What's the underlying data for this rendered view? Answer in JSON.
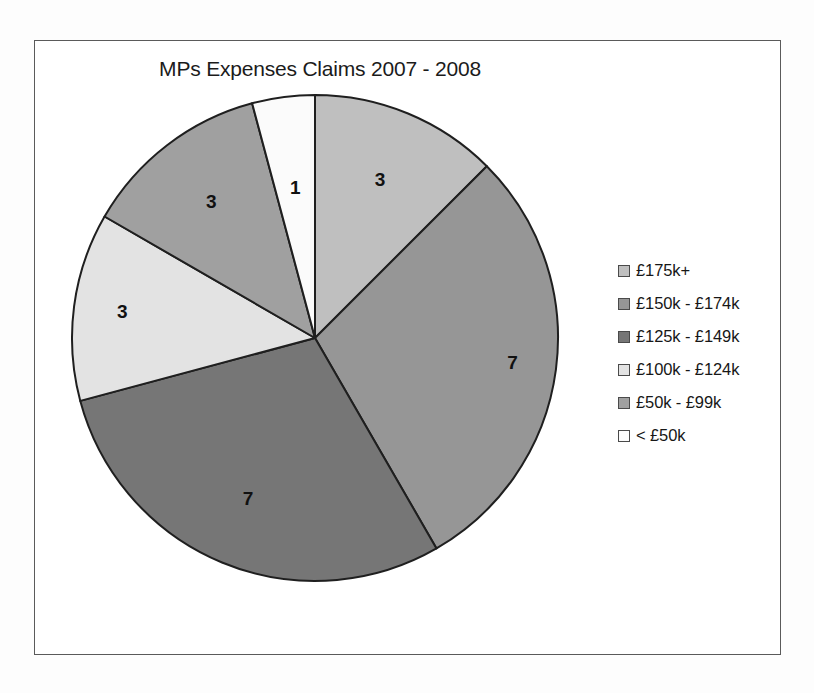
{
  "chart_data": {
    "type": "pie",
    "title": "MPs Expenses Claims 2007 - 2008",
    "xlabel": "",
    "ylabel": "",
    "legend_position": "right",
    "grid": false,
    "total": 24,
    "categories": [
      "£175k+",
      "£150k -  £174k",
      "£125k -  £149k",
      "£100k -  £124k",
      "£50k - £99k",
      "< £50k"
    ],
    "values": [
      3,
      7,
      7,
      3,
      3,
      1
    ],
    "colors": [
      "#bfbfbf",
      "#969696",
      "#767676",
      "#e3e3e3",
      "#a0a0a0",
      "#fbfbfb"
    ],
    "slices": [
      {
        "label": "£175k+",
        "value": 3,
        "value_label": "3",
        "color": "#bfbfbf",
        "start_deg": 0,
        "end_deg": 45
      },
      {
        "label": "£150k -  £174k",
        "value": 7,
        "value_label": "7",
        "color": "#969696",
        "start_deg": 45,
        "end_deg": 150
      },
      {
        "label": "£125k -  £149k",
        "value": 7,
        "value_label": "7",
        "color": "#767676",
        "start_deg": 150,
        "end_deg": 255
      },
      {
        "label": "£100k -  £124k",
        "value": 3,
        "value_label": "3",
        "color": "#e3e3e3",
        "start_deg": 255,
        "end_deg": 300
      },
      {
        "label": "£50k - £99k",
        "value": 3,
        "value_label": "3",
        "color": "#a0a0a0",
        "start_deg": 300,
        "end_deg": 345
      },
      {
        "label": "< £50k",
        "value": 1,
        "value_label": "1",
        "color": "#fbfbfb",
        "start_deg": 345,
        "end_deg": 360
      }
    ]
  },
  "chart": {
    "title": "MPs Expenses Claims 2007 - 2008"
  },
  "legend": {
    "items": [
      {
        "label": "£175k+",
        "color": "#bfbfbf"
      },
      {
        "label": "£150k -  £174k",
        "color": "#969696"
      },
      {
        "label": "£125k -  £149k",
        "color": "#767676"
      },
      {
        "label": "£100k -  £124k",
        "color": "#e3e3e3"
      },
      {
        "label": "£50k - £99k",
        "color": "#a0a0a0"
      },
      {
        "label": "< £50k",
        "color": "#fbfbfb"
      }
    ]
  },
  "style": {
    "slice_stroke": "#1f1f1f",
    "frame_border": "#5a5a5a",
    "text_color": "#171717",
    "background": "#fdfdfd"
  }
}
